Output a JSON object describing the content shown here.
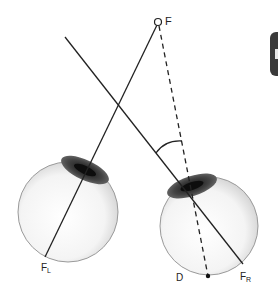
{
  "diagram": {
    "labels": {
      "fixation_point": "F",
      "left_fovea": "F",
      "left_fovea_sub": "L",
      "right_fovea": "F",
      "right_fovea_sub": "R",
      "deviation_point": "D"
    },
    "colors": {
      "line": "#222222",
      "eye_fill": "#f2f2f2",
      "eye_edge": "#888888",
      "iris": "#3a3a3a"
    }
  }
}
